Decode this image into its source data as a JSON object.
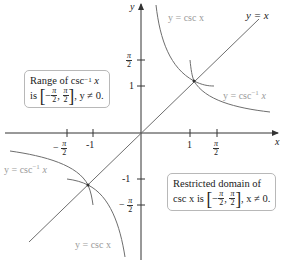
{
  "diagram": {
    "axes": {
      "x_label": "x",
      "y_label": "y",
      "x_ticks": [
        "-π/2",
        "-1",
        "1",
        "π/2"
      ],
      "y_ticks": [
        "π/2",
        "1",
        "-1",
        "-π/2"
      ]
    },
    "curve_labels": {
      "csc_upper": "y = csc x",
      "csc_lower": "y = csc x",
      "arccsc_right": "y = csc",
      "arccsc_left": "y = csc",
      "inverse_sup": "−1",
      "arccsc_var": "x",
      "identity": "y = x"
    },
    "range_box": {
      "line1_text": "Range of csc",
      "line1_sup": "−1",
      "line1_var": "x",
      "line2_prefix": "is",
      "line2_suffix": ", y ≠ 0."
    },
    "domain_box": {
      "line1": "Restricted domain of",
      "line2_prefix": "csc x is",
      "line2_suffix": ", x ≠ 0."
    },
    "interval": {
      "neg": "−",
      "pi": "π",
      "two": "2"
    },
    "colors": {
      "axis": "#333333",
      "curve": "#6e6e6e",
      "label_gray": "#9a9a9a",
      "box_border": "#b8b8b8"
    }
  }
}
